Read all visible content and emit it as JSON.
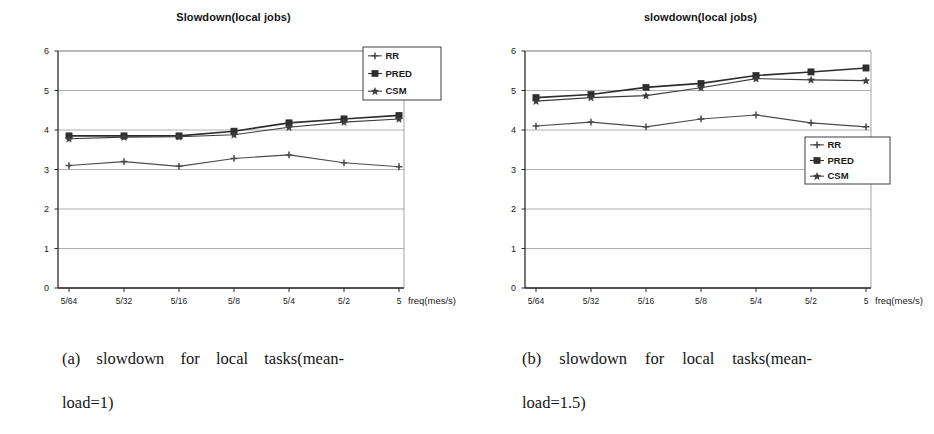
{
  "figure": {
    "panels": [
      {
        "id": "a",
        "title": "Slowdown(local jobs)",
        "caption_line1": "(a) slowdown for local tasks(mean-",
        "caption_line2": "load=1)",
        "legend_position": "top-right",
        "chart_data": {
          "type": "line",
          "title": "Slowdown(local jobs)",
          "xlabel": "freq(mes/s)",
          "ylabel": "",
          "categories": [
            "5/64",
            "5/32",
            "5/16",
            "5/8",
            "5/4",
            "5/2",
            "5"
          ],
          "yticks": [
            0,
            1,
            2,
            3,
            4,
            5,
            6
          ],
          "ylim": [
            0,
            6
          ],
          "grid": "horizontal",
          "legend": [
            "RR",
            "PRED",
            "CSM"
          ],
          "series": [
            {
              "name": "RR",
              "marker": "plus",
              "values": [
                3.1,
                3.2,
                3.08,
                3.28,
                3.37,
                3.17,
                3.07
              ]
            },
            {
              "name": "PRED",
              "marker": "square",
              "values": [
                3.85,
                3.85,
                3.85,
                3.97,
                4.18,
                4.28,
                4.37
              ]
            },
            {
              "name": "CSM",
              "marker": "star",
              "values": [
                3.78,
                3.82,
                3.83,
                3.88,
                4.07,
                4.2,
                4.28
              ]
            }
          ]
        }
      },
      {
        "id": "b",
        "title": "slowdown(local jobs)",
        "caption_line1": "(b) slowdown for local tasks(mean-",
        "caption_line2": "load=1.5)",
        "legend_position": "middle-right",
        "chart_data": {
          "type": "line",
          "title": "slowdown(local jobs)",
          "xlabel": "freq(mes/s)",
          "ylabel": "",
          "categories": [
            "5/64",
            "5/32",
            "5/16",
            "5/8",
            "5/4",
            "5/2",
            "5"
          ],
          "yticks": [
            0,
            1,
            2,
            3,
            4,
            5,
            6
          ],
          "ylim": [
            0,
            6
          ],
          "grid": "horizontal",
          "legend": [
            "RR",
            "PRED",
            "CSM"
          ],
          "series": [
            {
              "name": "RR",
              "marker": "plus",
              "values": [
                4.1,
                4.2,
                4.08,
                4.28,
                4.38,
                4.18,
                4.08
              ]
            },
            {
              "name": "PRED",
              "marker": "square",
              "values": [
                4.82,
                4.9,
                5.08,
                5.18,
                5.38,
                5.47,
                5.57
              ]
            },
            {
              "name": "CSM",
              "marker": "star",
              "values": [
                4.73,
                4.82,
                4.87,
                5.07,
                5.3,
                5.27,
                5.25
              ]
            }
          ]
        }
      }
    ],
    "colors": {
      "ink": "#1a1a1a",
      "axis": "#2b2b2b",
      "grid": "#8d8d8d",
      "series_rr": "#4a4a4a",
      "series_pred": "#2e2e2e",
      "series_csm": "#3d3d3d"
    }
  }
}
